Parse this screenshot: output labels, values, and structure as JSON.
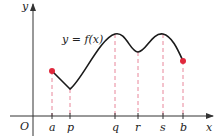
{
  "diagram": {
    "function_label": "y = f(x)",
    "axes": {
      "x_label": "x",
      "y_label": "y",
      "origin_label": "O"
    },
    "ticks": [
      {
        "label": "a",
        "x": 52
      },
      {
        "label": "p",
        "x": 70
      },
      {
        "label": "q",
        "x": 115
      },
      {
        "label": "r",
        "x": 138
      },
      {
        "label": "s",
        "x": 163
      },
      {
        "label": "b",
        "x": 183
      }
    ],
    "colors": {
      "curve": "#1a1a1a",
      "axis": "#333333",
      "dashed": "#e8869a",
      "endpoint": "#e0283c"
    }
  }
}
